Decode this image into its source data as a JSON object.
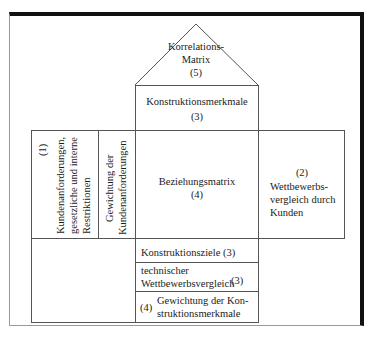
{
  "diagram": {
    "type": "house-of-quality",
    "roof": {
      "label_line1": "Korrelations-",
      "label_line2": "Matrix",
      "number": "(5)"
    },
    "design_characteristics": {
      "label": "Konstruktionsmerkmale",
      "number": "(3)"
    },
    "customer_requirements": {
      "number": "(1)",
      "label_line1": "Kundenanforderungen,",
      "label_line2": "gesetzliche und interne",
      "label_line3": "Restriktionen"
    },
    "requirement_weighting": {
      "label_line1": "Gewichtung der",
      "label_line2": "Kundenanforderungen",
      "number": "(2)"
    },
    "relationship_matrix": {
      "label": "Beziehungsmatrix",
      "number": "(4)"
    },
    "competitive_comparison_customer": {
      "number": "(2)",
      "label_line1": "Wettbewerbs-",
      "label_line2": "vergleich durch",
      "label_line3": "Kunden"
    },
    "design_targets": {
      "label": "Konstruktionsziele (3)"
    },
    "technical_comparison": {
      "label_line1": "technischer",
      "label_line2": "Wettbewerbsvergleich",
      "number": "(3)"
    },
    "characteristic_weighting": {
      "number": "(4)",
      "label_line1": "Gewichtung der Kon-",
      "label_line2": "struktionsmerkmale"
    }
  }
}
